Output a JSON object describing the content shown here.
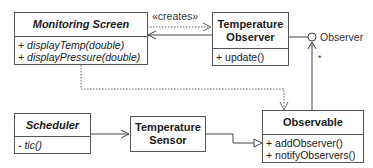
{
  "diagram": {
    "classes": {
      "monitoring_screen": {
        "name": "Monitoring Screen",
        "ops": [
          "+ displayTemp(double)",
          "+ displayPressure(double)"
        ]
      },
      "temperature_observer": {
        "name_line1": "Temperature",
        "name_line2": "Observer",
        "ops": [
          "+ update()"
        ]
      },
      "scheduler": {
        "name": "Scheduler",
        "ops": [
          "- tic()"
        ]
      },
      "temperature_sensor": {
        "name_line1": "Temperature",
        "name_line2": "Sensor"
      },
      "observable": {
        "name": "Observable",
        "ops": [
          "+ addObserver()",
          "+ notifyObservers()"
        ]
      }
    },
    "labels": {
      "creates": "«creates»",
      "observer_interface": "Observer",
      "multiplicity": "*"
    }
  }
}
